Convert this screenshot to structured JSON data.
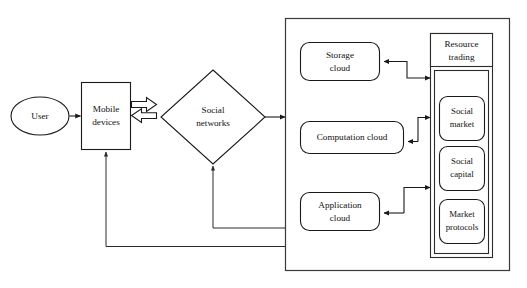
{
  "diagram": {
    "type": "architecture-block-diagram",
    "background_color": "#ffffff",
    "line_color": "#1a1a1a",
    "nodes": {
      "user": {
        "label": "User",
        "shape": "ellipse"
      },
      "mobile_devices": {
        "label_line1": "Mobile",
        "label_line2": "devices",
        "shape": "rectangle"
      },
      "social_networks": {
        "label_line1": "Social",
        "label_line2": "networks",
        "shape": "diamond"
      },
      "storage_cloud": {
        "label_line1": "Storage",
        "label_line2": "cloud",
        "shape": "rounded-rectangle"
      },
      "computation_cloud": {
        "label_line1": "Computation cloud",
        "label_line2": "",
        "shape": "rounded-rectangle"
      },
      "application_cloud": {
        "label_line1": "Application",
        "label_line2": "cloud",
        "shape": "rounded-rectangle"
      },
      "resource_trading": {
        "label_line1": "Resource",
        "label_line2": "trading",
        "shape": "rectangle-header"
      },
      "social_market": {
        "label_line1": "Social",
        "label_line2": "market",
        "shape": "rounded-rectangle"
      },
      "social_capital": {
        "label_line1": "Social",
        "label_line2": "capital",
        "shape": "rounded-rectangle"
      },
      "market_protocols": {
        "label_line1": "Market",
        "label_line2": "protocols",
        "shape": "rounded-rectangle"
      }
    },
    "edges": [
      {
        "from": "user",
        "to": "mobile_devices",
        "style": "arrow"
      },
      {
        "from": "mobile_devices",
        "to": "social_networks",
        "style": "block-arrow-right"
      },
      {
        "from": "social_networks",
        "to": "mobile_devices",
        "style": "block-arrow-left"
      },
      {
        "from": "social_networks",
        "to": "cloud_container",
        "style": "arrow"
      },
      {
        "from": "resource_trading",
        "to": "storage_cloud",
        "style": "arrow"
      },
      {
        "from": "storage_cloud",
        "to": "resource_trading",
        "style": "arrow"
      },
      {
        "from": "resource_trading",
        "to": "computation_cloud",
        "style": "arrow"
      },
      {
        "from": "computation_cloud",
        "to": "resource_trading",
        "style": "arrow"
      },
      {
        "from": "resource_trading",
        "to": "application_cloud",
        "style": "arrow"
      },
      {
        "from": "application_cloud",
        "to": "resource_trading",
        "style": "arrow"
      },
      {
        "from": "cloud_container",
        "to": "social_networks",
        "style": "feedback-arrow"
      },
      {
        "from": "cloud_container",
        "to": "mobile_devices",
        "style": "feedback-arrow"
      }
    ]
  }
}
